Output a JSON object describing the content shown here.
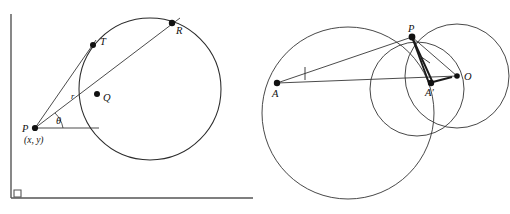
{
  "figure": {
    "background_color": "#ffffff",
    "stroke_color": "#2b2b2b",
    "axis_color": "#555555",
    "point_color": "#111111"
  },
  "left_diagram": {
    "name": "polar-point-circle-diagram",
    "description": "A circle intersected by two rays from external point P; angle theta measured from horizontal, radius r to Q.",
    "axes": {
      "y_axis_label": "",
      "x_axis_label": "",
      "origin_right_angle_marker": true
    },
    "circle": {
      "center_x": 150,
      "center_y": 89,
      "radius": 71
    },
    "points": [
      {
        "id": "P",
        "label": "P",
        "x": 35,
        "y": 128
      },
      {
        "id": "Q",
        "label": "Q",
        "x": 97,
        "y": 94
      },
      {
        "id": "T",
        "label": "T",
        "x": 93,
        "y": 45
      },
      {
        "id": "R",
        "label": "R",
        "x": 172,
        "y": 23
      }
    ],
    "annotations": {
      "coordinates": "(x, y)",
      "angle": "θ",
      "radius": "r"
    },
    "segments": [
      {
        "from": "P",
        "to": "T",
        "kind": "ray"
      },
      {
        "from": "P",
        "to": "R",
        "kind": "ray"
      },
      {
        "from": "P",
        "to": "horizontal",
        "kind": "baseline"
      }
    ]
  },
  "right_diagram": {
    "name": "inversion-circles-diagram",
    "description": "Three mutually intersecting circles with points A, A prime, P and center O; segments from A and O meeting at P.",
    "circles": [
      {
        "id": "big-circle",
        "center_x": 348,
        "center_y": 113,
        "radius": 86
      },
      {
        "id": "right-circle",
        "center_x": 457,
        "center_y": 76,
        "radius": 52
      },
      {
        "id": "medium-circle",
        "center_x": 417,
        "center_y": 89,
        "radius": 47
      }
    ],
    "points": [
      {
        "id": "A",
        "label": "A",
        "x": 277,
        "y": 83
      },
      {
        "id": "A-prime",
        "label": "A′",
        "x": 433,
        "y": 83
      },
      {
        "id": "P",
        "label": "P",
        "x": 412,
        "y": 37
      },
      {
        "id": "O",
        "label": "O",
        "x": 457,
        "y": 76
      }
    ],
    "segments": [
      {
        "from": "A",
        "to": "P",
        "kind": "ray"
      },
      {
        "from": "A",
        "to": "O",
        "kind": "baseline"
      },
      {
        "from": "P",
        "to": "A-prime",
        "kind": "ray-bold"
      },
      {
        "from": "P",
        "to": "O",
        "kind": "ray"
      },
      {
        "from": "A-prime",
        "to": "O",
        "kind": "ray-bold"
      }
    ],
    "annotations": {
      "angle_tick_at_A": true,
      "angle_tick_at_P": true
    }
  }
}
